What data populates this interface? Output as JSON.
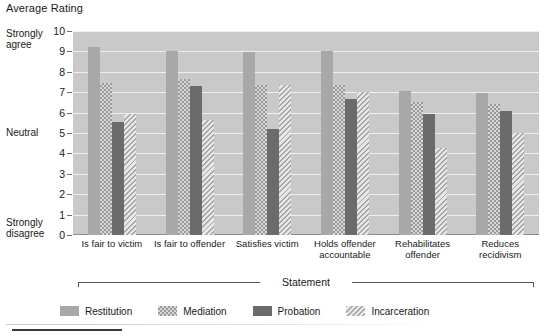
{
  "chart_data": {
    "type": "bar",
    "title": "Average Rating",
    "xlabel": "Statement",
    "ylabel": "",
    "ylim": [
      0,
      10
    ],
    "yticks": [
      0,
      1,
      2,
      3,
      4,
      5,
      6,
      7,
      8,
      9,
      10
    ],
    "grid": true,
    "legend_position": "bottom",
    "y_anchor_labels": {
      "top": "Strongly\nagree",
      "top_line1": "Strongly",
      "top_line2": "agree",
      "middle": "Neutral",
      "bottom_line1": "Strongly",
      "bottom_line2": "disagree"
    },
    "categories": [
      "Is fair to victim",
      "Is fair to offender",
      "Satisfies victim",
      "Holds offender accountable",
      "Rehabilitates offender",
      "Reduces recidivism"
    ],
    "series": [
      {
        "name": "Restitution",
        "color": "#a8a8a8",
        "pattern": "solid-light",
        "values": [
          9.2,
          9.0,
          8.95,
          9.0,
          7.05,
          6.95
        ]
      },
      {
        "name": "Mediation",
        "color": "#d7d7d7",
        "pattern": "checker",
        "values": [
          7.45,
          7.65,
          7.35,
          7.35,
          6.5,
          6.4
        ]
      },
      {
        "name": "Probation",
        "color": "#6b6b6b",
        "pattern": "solid-dark",
        "values": [
          5.55,
          7.3,
          5.2,
          6.65,
          5.95,
          6.1
        ]
      },
      {
        "name": "Incarceration",
        "color": "#dcdcdc",
        "pattern": "diagonal",
        "values": [
          5.95,
          5.65,
          7.35,
          7.0,
          4.25,
          5.0
        ]
      }
    ]
  },
  "colors": {
    "plot_background": "#c9c9c9",
    "gridline": "#efefef",
    "axis": "#6e6e6e"
  }
}
